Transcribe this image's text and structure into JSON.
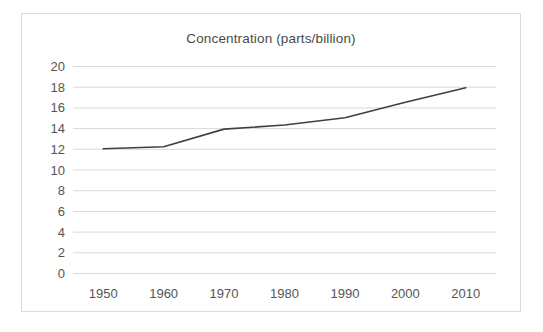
{
  "chart_data": {
    "type": "line",
    "title": "Concentration (parts/billion)",
    "xlabel": "",
    "ylabel": "",
    "x": [
      1950,
      1960,
      1970,
      1980,
      1990,
      2000,
      2010
    ],
    "values": [
      12.0,
      12.2,
      13.9,
      14.3,
      15.0,
      16.5,
      17.9
    ],
    "series": [
      {
        "name": "Concentration",
        "values": [
          12.0,
          12.2,
          13.9,
          14.3,
          15.0,
          16.5,
          17.9
        ]
      }
    ],
    "x_tick_labels": [
      "1950",
      "1960",
      "1970",
      "1980",
      "1990",
      "2000",
      "2010"
    ],
    "y_tick_labels": [
      "0",
      "2",
      "4",
      "6",
      "8",
      "10",
      "12",
      "14",
      "16",
      "18",
      "20"
    ],
    "y_ticks": [
      0,
      2,
      4,
      6,
      8,
      10,
      12,
      14,
      16,
      18,
      20
    ],
    "xlim": [
      1945,
      2015
    ],
    "ylim": [
      0,
      20
    ],
    "grid": "horizontal",
    "legend": "none",
    "line_color": "#404040",
    "grid_color": "#d9d9d9",
    "border_color": "#dcdcdc",
    "background_color": "#ffffff",
    "text_color": "#555555"
  }
}
